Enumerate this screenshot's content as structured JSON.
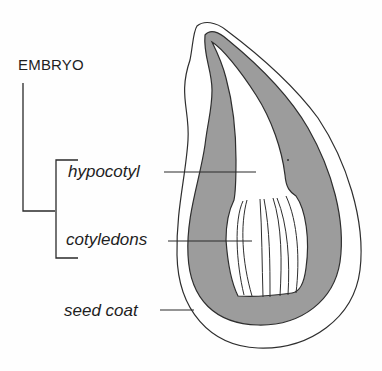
{
  "diagram": {
    "group_label": "EMBRYO",
    "labels": {
      "hypocotyl": "hypocotyl",
      "cotyledons": "cotyledons",
      "seed_coat": "seed coat"
    },
    "colors": {
      "line": "#2a2a2a",
      "endosperm_fill": "#9a9a9a",
      "background": "#fefefe"
    }
  }
}
